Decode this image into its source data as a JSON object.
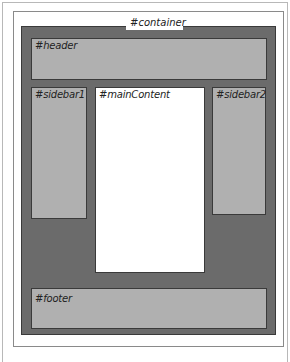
{
  "diagram": {
    "type": "css-layout-boxes",
    "container": {
      "label": "#container",
      "color": "#6b6b6b"
    },
    "header": {
      "label": "#header",
      "color": "#b0b0b0"
    },
    "sidebar1": {
      "label": "#sidebar1",
      "color": "#b0b0b0"
    },
    "mainContent": {
      "label": "#mainContent",
      "color": "#ffffff"
    },
    "sidebar2": {
      "label": "#sidebar2",
      "color": "#b0b0b0"
    },
    "footer": {
      "label": "#footer",
      "color": "#b0b0b0"
    }
  }
}
